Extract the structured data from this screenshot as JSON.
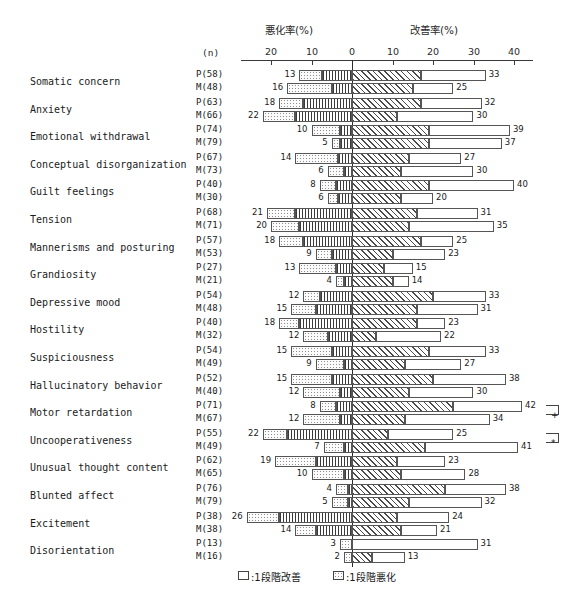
{
  "header": {
    "worsening_title": "悪化率(%)",
    "improvement_title": "改善率(%)",
    "n_header": "(n)"
  },
  "axis": {
    "left_ticks": [
      "20",
      "10"
    ],
    "zero_tick": "0",
    "right_ticks": [
      "10",
      "20",
      "30",
      "40"
    ],
    "left_max": 20,
    "right_max": 40
  },
  "legend": {
    "improve_label": ":1段階改善",
    "worsen_label": ":1段階悪化"
  },
  "significance": {
    "motor_retardation_mark": "+",
    "uncooperativeness_mark": "*"
  },
  "chart_data": {
    "type": "bar",
    "title": "",
    "subtitle": "",
    "xlabel_left": "悪化率(%)",
    "xlabel_right": "改善率(%)",
    "ylabel": "",
    "orientation": "horizontal-diverging",
    "xlim": [
      -20,
      40
    ],
    "grid": false,
    "legend_position": "bottom-center",
    "legend_entries": [
      ":1段階改善",
      ":1段階悪化"
    ],
    "group_labels": [
      "P",
      "M"
    ],
    "series_note": "Each item has two bars: P (upper) and M (lower). Worsening extends left of 0, improvement right of 0. Inner segment = 2-stage change, outer segment = 1-stage change.",
    "categories": [
      "Somatic concern",
      "Anxiety",
      "Emotional withdrawal",
      "Conceptual disorganization",
      "Guilt feelings",
      "Tension",
      "Mannerisms and posturing",
      "Grandiosity",
      "Depressive mood",
      "Hostility",
      "Suspiciousness",
      "Hallucinatory behavior",
      "Motor retardation",
      "Uncooperativeness",
      "Unusual thought content",
      "Blunted affect",
      "Excitement",
      "Disorientation"
    ],
    "rows": [
      {
        "item": "Somatic concern",
        "p": {
          "n_label": "P(58)",
          "n": 58,
          "worsen_total": 13,
          "worsen_inner": 7.5,
          "improve_total": 33,
          "improve_inner": 17
        },
        "m": {
          "n_label": "M(48)",
          "n": 48,
          "worsen_total": 16,
          "worsen_inner": 5,
          "improve_total": 25,
          "improve_inner": 15
        }
      },
      {
        "item": "Anxiety",
        "p": {
          "n_label": "P(63)",
          "n": 63,
          "worsen_total": 18,
          "worsen_inner": 12,
          "improve_total": 32,
          "improve_inner": 17
        },
        "m": {
          "n_label": "M(66)",
          "n": 66,
          "worsen_total": 22,
          "worsen_inner": 14,
          "improve_total": 30,
          "improve_inner": 11
        }
      },
      {
        "item": "Emotional withdrawal",
        "p": {
          "n_label": "P(74)",
          "n": 74,
          "worsen_total": 10,
          "worsen_inner": 3,
          "improve_total": 39,
          "improve_inner": 19
        },
        "m": {
          "n_label": "M(79)",
          "n": 79,
          "worsen_total": 5,
          "worsen_inner": 3,
          "improve_total": 37,
          "improve_inner": 19
        }
      },
      {
        "item": "Conceptual disorganization",
        "p": {
          "n_label": "P(67)",
          "n": 67,
          "worsen_total": 14,
          "worsen_inner": 3.5,
          "improve_total": 27,
          "improve_inner": 14
        },
        "m": {
          "n_label": "M(73)",
          "n": 73,
          "worsen_total": 6,
          "worsen_inner": 2,
          "improve_total": 30,
          "improve_inner": 12
        }
      },
      {
        "item": "Guilt feelings",
        "p": {
          "n_label": "P(40)",
          "n": 40,
          "worsen_total": 8,
          "worsen_inner": 4,
          "improve_total": 40,
          "improve_inner": 19
        },
        "m": {
          "n_label": "M(30)",
          "n": 30,
          "worsen_total": 6,
          "worsen_inner": 3.5,
          "improve_total": 20,
          "improve_inner": 12
        }
      },
      {
        "item": "Tension",
        "p": {
          "n_label": "P(68)",
          "n": 68,
          "worsen_total": 21,
          "worsen_inner": 14,
          "improve_total": 31,
          "improve_inner": 16
        },
        "m": {
          "n_label": "M(71)",
          "n": 71,
          "worsen_total": 20,
          "worsen_inner": 13,
          "improve_total": 35,
          "improve_inner": 14
        }
      },
      {
        "item": "Mannerisms and posturing",
        "p": {
          "n_label": "P(57)",
          "n": 57,
          "worsen_total": 18,
          "worsen_inner": 12,
          "improve_total": 25,
          "improve_inner": 17
        },
        "m": {
          "n_label": "M(53)",
          "n": 53,
          "worsen_total": 9,
          "worsen_inner": 5,
          "improve_total": 23,
          "improve_inner": 10
        }
      },
      {
        "item": "Grandiosity",
        "p": {
          "n_label": "P(27)",
          "n": 27,
          "worsen_total": 13,
          "worsen_inner": 4,
          "improve_total": 15,
          "improve_inner": 8
        },
        "m": {
          "n_label": "M(21)",
          "n": 21,
          "worsen_total": 4,
          "worsen_inner": 2,
          "improve_total": 14,
          "improve_inner": 10
        }
      },
      {
        "item": "Depressive mood",
        "p": {
          "n_label": "P(54)",
          "n": 54,
          "worsen_total": 12,
          "worsen_inner": 8,
          "improve_total": 33,
          "improve_inner": 20
        },
        "m": {
          "n_label": "M(48)",
          "n": 48,
          "worsen_total": 15,
          "worsen_inner": 9,
          "improve_total": 31,
          "improve_inner": 16
        }
      },
      {
        "item": "Hostility",
        "p": {
          "n_label": "P(40)",
          "n": 40,
          "worsen_total": 18,
          "worsen_inner": 13,
          "improve_total": 23,
          "improve_inner": 16
        },
        "m": {
          "n_label": "M(32)",
          "n": 32,
          "worsen_total": 12,
          "worsen_inner": 6,
          "improve_total": 22,
          "improve_inner": 6
        }
      },
      {
        "item": "Suspiciousness",
        "p": {
          "n_label": "P(54)",
          "n": 54,
          "worsen_total": 15,
          "worsen_inner": 5,
          "improve_total": 33,
          "improve_inner": 19
        },
        "m": {
          "n_label": "M(49)",
          "n": 49,
          "worsen_total": 9,
          "worsen_inner": 2,
          "improve_total": 27,
          "improve_inner": 13
        }
      },
      {
        "item": "Hallucinatory behavior",
        "p": {
          "n_label": "P(52)",
          "n": 52,
          "worsen_total": 15,
          "worsen_inner": 5,
          "improve_total": 38,
          "improve_inner": 20
        },
        "m": {
          "n_label": "M(40)",
          "n": 40,
          "worsen_total": 12,
          "worsen_inner": 3,
          "improve_total": 30,
          "improve_inner": 14
        }
      },
      {
        "item": "Motor retardation",
        "p": {
          "n_label": "P(71)",
          "n": 71,
          "worsen_total": 8,
          "worsen_inner": 4,
          "improve_total": 42,
          "improve_inner": 25
        },
        "m": {
          "n_label": "M(67)",
          "n": 67,
          "worsen_total": 12,
          "worsen_inner": 3,
          "improve_total": 34,
          "improve_inner": 13
        }
      },
      {
        "item": "Uncooperativeness",
        "p": {
          "n_label": "P(55)",
          "n": 55,
          "worsen_total": 22,
          "worsen_inner": 16,
          "improve_total": 25,
          "improve_inner": 9
        },
        "m": {
          "n_label": "M(49)",
          "n": 49,
          "worsen_total": 7,
          "worsen_inner": 2,
          "improve_total": 41,
          "improve_inner": 18
        }
      },
      {
        "item": "Unusual thought content",
        "p": {
          "n_label": "P(62)",
          "n": 62,
          "worsen_total": 19,
          "worsen_inner": 9,
          "improve_total": 23,
          "improve_inner": 11
        },
        "m": {
          "n_label": "M(65)",
          "n": 65,
          "worsen_total": 10,
          "worsen_inner": 2,
          "improve_total": 28,
          "improve_inner": 12
        }
      },
      {
        "item": "Blunted affect",
        "p": {
          "n_label": "P(76)",
          "n": 76,
          "worsen_total": 4,
          "worsen_inner": 1,
          "improve_total": 38,
          "improve_inner": 23
        },
        "m": {
          "n_label": "M(79)",
          "n": 79,
          "worsen_total": 5,
          "worsen_inner": 1,
          "improve_total": 32,
          "improve_inner": 14
        }
      },
      {
        "item": "Excitement",
        "p": {
          "n_label": "P(38)",
          "n": 38,
          "worsen_total": 26,
          "worsen_inner": 18,
          "improve_total": 24,
          "improve_inner": 11
        },
        "m": {
          "n_label": "M(38)",
          "n": 38,
          "worsen_total": 14,
          "worsen_inner": 9,
          "improve_total": 21,
          "improve_inner": 12
        }
      },
      {
        "item": "Disorientation",
        "p": {
          "n_label": "P(13)",
          "n": 13,
          "worsen_total": 3,
          "worsen_inner": 0,
          "improve_total": 31,
          "improve_inner": 0
        },
        "m": {
          "n_label": "M(16)",
          "n": 16,
          "worsen_total": 2,
          "worsen_inner": 0,
          "improve_total": 13,
          "improve_inner": 5
        }
      }
    ]
  }
}
